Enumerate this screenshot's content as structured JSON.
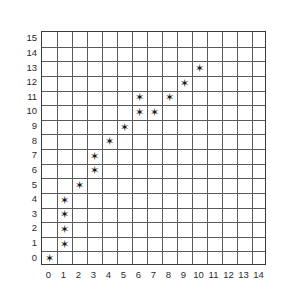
{
  "chart_data": {
    "type": "scatter",
    "title": "",
    "xlabel": "",
    "ylabel": "",
    "xlim": [
      0,
      15
    ],
    "ylim": [
      0,
      16
    ],
    "grid": true,
    "legend": null,
    "marker": "star",
    "marker_color": "#1b1b1b",
    "marker_glyph": "✶",
    "x_ticks": [
      0,
      1,
      2,
      3,
      4,
      5,
      6,
      7,
      8,
      9,
      10,
      11,
      12,
      13,
      14
    ],
    "y_ticks": [
      0,
      1,
      2,
      3,
      4,
      5,
      6,
      7,
      8,
      9,
      10,
      11,
      12,
      13,
      14,
      15
    ],
    "x": [
      0,
      1,
      1,
      1,
      1,
      2,
      3,
      3,
      4,
      5,
      6,
      6,
      7,
      8,
      9,
      10
    ],
    "y": [
      0,
      1,
      2,
      3,
      4,
      5,
      6,
      7,
      8,
      9,
      10,
      11,
      10,
      11,
      12,
      13
    ],
    "points": [
      {
        "x": 0,
        "y": 0
      },
      {
        "x": 1,
        "y": 1
      },
      {
        "x": 1,
        "y": 2
      },
      {
        "x": 1,
        "y": 3
      },
      {
        "x": 1,
        "y": 4
      },
      {
        "x": 2,
        "y": 5
      },
      {
        "x": 3,
        "y": 6
      },
      {
        "x": 3,
        "y": 7
      },
      {
        "x": 4,
        "y": 8
      },
      {
        "x": 5,
        "y": 9
      },
      {
        "x": 6,
        "y": 10
      },
      {
        "x": 7,
        "y": 10
      },
      {
        "x": 6,
        "y": 11
      },
      {
        "x": 8,
        "y": 11
      },
      {
        "x": 9,
        "y": 12
      },
      {
        "x": 10,
        "y": 13
      }
    ]
  },
  "colors": {
    "background": "#ffffff",
    "grid": "#5a5a5a",
    "axis": "#3a3a3a",
    "marker": "#1b1b1b",
    "tick_text": "#2b2b2b"
  }
}
